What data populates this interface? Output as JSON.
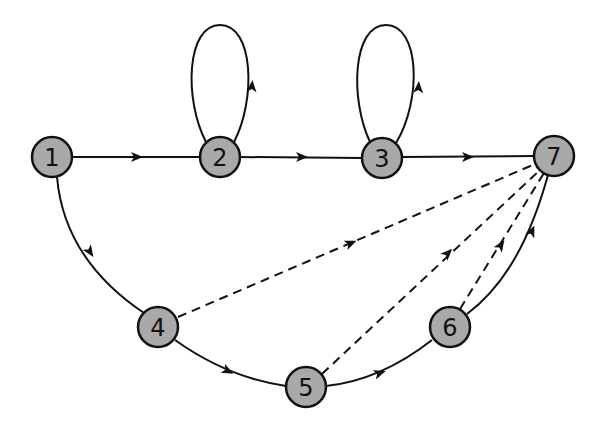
{
  "diagram": {
    "type": "directed-graph",
    "colors": {
      "background": "#ffffff",
      "node_fill": "#a9a9a9",
      "stroke": "#111111"
    },
    "nodes": [
      {
        "id": "1",
        "label": "1",
        "x": 52,
        "y": 157
      },
      {
        "id": "2",
        "label": "2",
        "x": 220,
        "y": 157
      },
      {
        "id": "3",
        "label": "3",
        "x": 382,
        "y": 158
      },
      {
        "id": "4",
        "label": "4",
        "x": 158,
        "y": 327
      },
      {
        "id": "5",
        "label": "5",
        "x": 306,
        "y": 387
      },
      {
        "id": "6",
        "label": "6",
        "x": 450,
        "y": 327
      },
      {
        "id": "7",
        "label": "7",
        "x": 554,
        "y": 156
      }
    ],
    "edges": [
      {
        "from": "1",
        "to": "2",
        "style": "solid"
      },
      {
        "from": "2",
        "to": "3",
        "style": "solid"
      },
      {
        "from": "3",
        "to": "7",
        "style": "solid"
      },
      {
        "from": "2",
        "to": "2",
        "style": "solid",
        "kind": "self-loop"
      },
      {
        "from": "3",
        "to": "3",
        "style": "solid",
        "kind": "self-loop"
      },
      {
        "from": "1",
        "to": "4",
        "style": "solid"
      },
      {
        "from": "4",
        "to": "5",
        "style": "solid"
      },
      {
        "from": "5",
        "to": "6",
        "style": "solid"
      },
      {
        "from": "6",
        "to": "7",
        "style": "solid"
      },
      {
        "from": "4",
        "to": "7",
        "style": "dashed"
      },
      {
        "from": "5",
        "to": "7",
        "style": "dashed"
      },
      {
        "from": "6",
        "to": "7",
        "style": "dashed"
      }
    ]
  }
}
